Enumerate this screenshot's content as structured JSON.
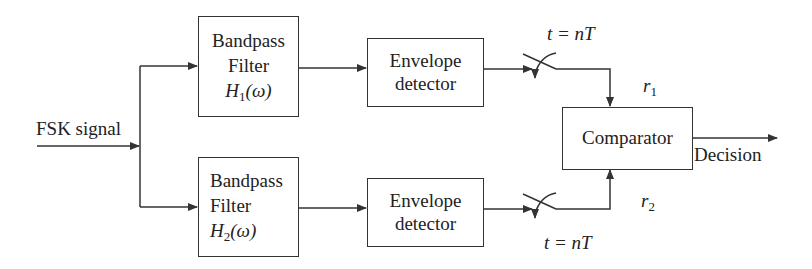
{
  "diagram": {
    "input_label": "FSK signal",
    "branches": [
      {
        "filter": {
          "line1": "Bandpass",
          "line2": "Filter",
          "transfer_symbol": "H",
          "transfer_sub": "1",
          "transfer_arg": "(ω)"
        },
        "detector": {
          "line1": "Envelope",
          "line2": "detector"
        },
        "sampler_label": "t = nT",
        "output_label_symbol": "r",
        "output_label_sub": "1"
      },
      {
        "filter": {
          "line1": "Bandpass",
          "line2": "Filter",
          "transfer_symbol": "H",
          "transfer_sub": "2",
          "transfer_arg": "(ω)"
        },
        "detector": {
          "line1": "Envelope",
          "line2": "detector"
        },
        "sampler_label": "t = nT",
        "output_label_symbol": "r",
        "output_label_sub": "2"
      }
    ],
    "comparator_label": "Comparator",
    "output_label": "Decision",
    "colors": {
      "line": "#333333",
      "text": "#222222",
      "background": "#ffffff"
    }
  }
}
